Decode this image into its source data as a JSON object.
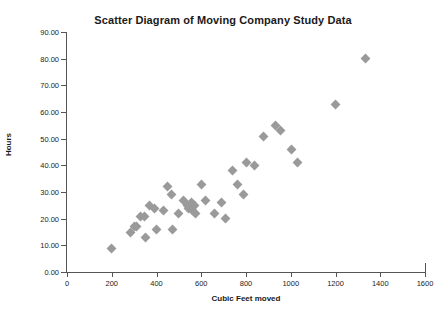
{
  "chart_data": {
    "type": "scatter",
    "title": "Scatter Diagram of Moving Company Study Data",
    "xlabel": "Cubic Feet moved",
    "ylabel": "Hours",
    "xlim": [
      0,
      1600
    ],
    "ylim": [
      0,
      90
    ],
    "xticks": [
      0,
      200,
      400,
      600,
      800,
      1000,
      1200,
      1400,
      1600
    ],
    "xtick_labels": [
      "0",
      "200",
      "400",
      "600",
      "800",
      "1000",
      "1200",
      "1400",
      "1600"
    ],
    "yticks": [
      0,
      10,
      20,
      30,
      40,
      50,
      60,
      70,
      80,
      90
    ],
    "ytick_labels": [
      "0.00",
      "10.00",
      "20.00",
      "30.00",
      "40.00",
      "50.00",
      "60.00",
      "70.00",
      "80.00",
      "90.00"
    ],
    "grid": false,
    "legend": false,
    "marker": "diamond",
    "marker_color": "#9a9a9a",
    "points": [
      {
        "x": 200,
        "y": 9
      },
      {
        "x": 285,
        "y": 15
      },
      {
        "x": 300,
        "y": 17
      },
      {
        "x": 310,
        "y": 17
      },
      {
        "x": 330,
        "y": 21
      },
      {
        "x": 345,
        "y": 21
      },
      {
        "x": 350,
        "y": 13
      },
      {
        "x": 370,
        "y": 25
      },
      {
        "x": 390,
        "y": 24
      },
      {
        "x": 400,
        "y": 16
      },
      {
        "x": 430,
        "y": 23
      },
      {
        "x": 450,
        "y": 32
      },
      {
        "x": 465,
        "y": 29
      },
      {
        "x": 470,
        "y": 16
      },
      {
        "x": 500,
        "y": 22
      },
      {
        "x": 520,
        "y": 27
      },
      {
        "x": 540,
        "y": 25
      },
      {
        "x": 545,
        "y": 24
      },
      {
        "x": 555,
        "y": 26
      },
      {
        "x": 560,
        "y": 23
      },
      {
        "x": 570,
        "y": 25
      },
      {
        "x": 575,
        "y": 22
      },
      {
        "x": 600,
        "y": 33
      },
      {
        "x": 620,
        "y": 27
      },
      {
        "x": 660,
        "y": 22
      },
      {
        "x": 690,
        "y": 26
      },
      {
        "x": 710,
        "y": 20
      },
      {
        "x": 740,
        "y": 38
      },
      {
        "x": 760,
        "y": 33
      },
      {
        "x": 790,
        "y": 29
      },
      {
        "x": 800,
        "y": 41
      },
      {
        "x": 840,
        "y": 40
      },
      {
        "x": 880,
        "y": 51
      },
      {
        "x": 930,
        "y": 55
      },
      {
        "x": 955,
        "y": 53
      },
      {
        "x": 1005,
        "y": 46
      },
      {
        "x": 1030,
        "y": 41
      },
      {
        "x": 1200,
        "y": 63
      },
      {
        "x": 1335,
        "y": 80
      }
    ]
  }
}
